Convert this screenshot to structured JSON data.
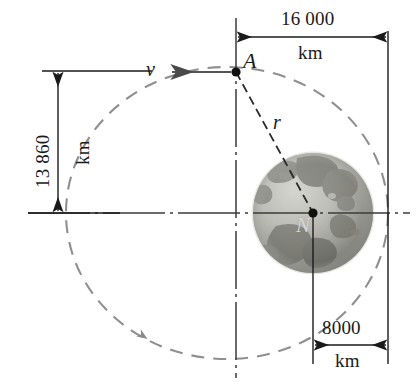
{
  "figure": {
    "type": "technical-diagram"
  },
  "labels": {
    "apogee_point": "A",
    "velocity": "v",
    "radius": "r",
    "earth_center": "N"
  },
  "dimensions": {
    "top": {
      "value": "16 000",
      "unit": "km",
      "orientation": "horizontal",
      "description": "distance from vertical axis through A to right extension line"
    },
    "left": {
      "value": "13 860",
      "unit": "km",
      "orientation": "vertical",
      "description": "distance from level of A down to horizontal centerline"
    },
    "bottom": {
      "value": "8000",
      "unit": "km",
      "orientation": "horizontal",
      "description": "distance from Earth center to right extension line"
    }
  },
  "colors": {
    "line": "#1a1a1a",
    "orbit": "#8a8a8a",
    "background": "#ffffff",
    "earth_light": "#c9c9c4",
    "earth_dark": "#6e6e68"
  },
  "geometry": {
    "point_A": {
      "x": 236,
      "y": 72
    },
    "earth_center": {
      "x": 313,
      "y": 213
    },
    "earth_radius": 60,
    "orbit_center": {
      "x": 227,
      "y": 213
    },
    "orbit_rx": 161,
    "orbit_ry": 146
  }
}
